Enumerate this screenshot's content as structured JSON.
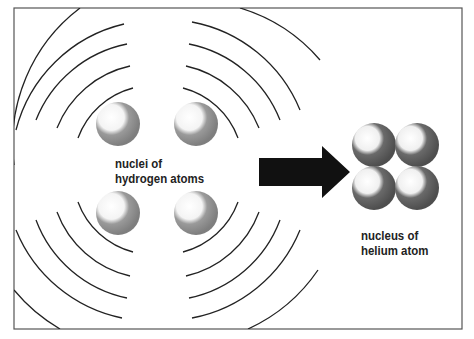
{
  "diagram": {
    "labels": {
      "hydrogen_line1": "nuclei of",
      "hydrogen_line2": "hydrogen atoms",
      "helium_line1": "nucleus of",
      "helium_line2": "helium atom"
    },
    "hydrogen_nuclei_count": 4,
    "helium_nucleus_particles": 4,
    "colors": {
      "frame": "#555555",
      "wave_lines": "#222222",
      "arrow": "#111111",
      "hydrogen_sphere": "#8a8a8a",
      "helium_sphere": "#5c5c5c",
      "highlight": "#ffffff"
    }
  }
}
